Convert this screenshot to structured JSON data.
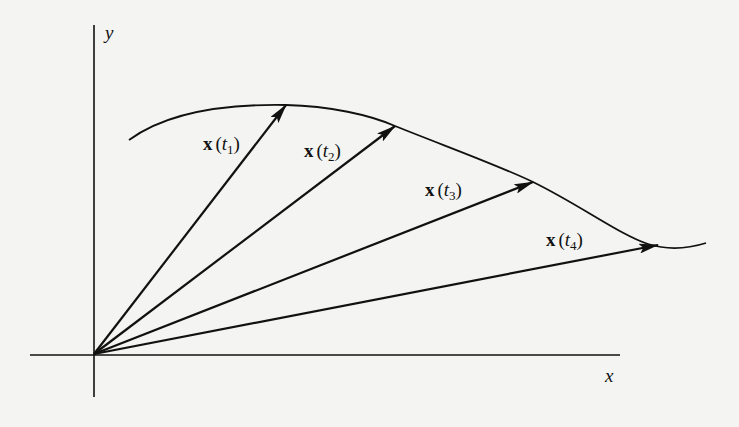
{
  "figure": {
    "axes": {
      "x_label": "x",
      "y_label": "y",
      "origin": [
        94,
        354
      ],
      "x_axis": [
        30,
        620
      ],
      "y_axis": [
        25,
        397
      ]
    },
    "curve": {
      "path": "M129,140 C170,110 230,104 286,105 C330,106 370,115 395,126 C450,148 500,166 533,182 C580,205 620,235 648,244 C670,251 690,248 706,243"
    },
    "vectors": [
      {
        "label_bold": "x",
        "label_open": "(",
        "label_var": "t",
        "label_sub": "1",
        "label_close": ")",
        "tip": [
          286,
          105
        ],
        "label_pos": [
          203,
          150
        ]
      },
      {
        "label_bold": "x",
        "label_open": "(",
        "label_var": "t",
        "label_sub": "2",
        "label_close": ")",
        "tip": [
          395,
          126
        ],
        "label_pos": [
          304,
          157
        ]
      },
      {
        "label_bold": "x",
        "label_open": "(",
        "label_var": "t",
        "label_sub": "3",
        "label_close": ")",
        "tip": [
          533,
          182
        ],
        "label_pos": [
          425,
          196
        ]
      },
      {
        "label_bold": "x",
        "label_open": "(",
        "label_var": "t",
        "label_sub": "4",
        "label_close": ")",
        "tip": [
          658,
          245
        ],
        "label_pos": [
          546,
          246
        ]
      }
    ],
    "colors": {
      "ink": "#111111",
      "paper": "#f4f4f2"
    }
  }
}
